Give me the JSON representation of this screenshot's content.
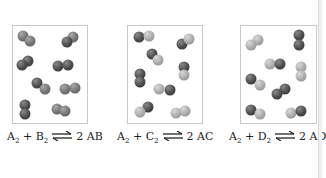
{
  "figure": {
    "panels": [
      {
        "id": "AB",
        "equation": {
          "r1": "A",
          "r1_sub": "2",
          "plus": "+",
          "r2": "B",
          "r2_sub": "2",
          "coef": "2",
          "product": "AB"
        },
        "box": {
          "x": 12,
          "y": 25,
          "w": 76,
          "h": 99
        },
        "molecules": [
          [
            {
              "x": 23,
              "y": 36,
              "c": "mid"
            },
            {
              "x": 30,
              "y": 41,
              "c": "mid"
            }
          ],
          [
            {
              "x": 73,
              "y": 37,
              "c": "mid"
            },
            {
              "x": 67,
              "y": 42,
              "c": "dark"
            }
          ],
          [
            {
              "x": 28,
              "y": 61,
              "c": "dark"
            },
            {
              "x": 22,
              "y": 65,
              "c": "dark"
            }
          ],
          [
            {
              "x": 58,
              "y": 66,
              "c": "dark"
            },
            {
              "x": 68,
              "y": 65,
              "c": "dark"
            }
          ],
          [
            {
              "x": 37,
              "y": 83,
              "c": "dark"
            },
            {
              "x": 45,
              "y": 89,
              "c": "mid"
            }
          ],
          [
            {
              "x": 65,
              "y": 89,
              "c": "mid"
            },
            {
              "x": 75,
              "y": 88,
              "c": "mid"
            }
          ],
          [
            {
              "x": 25,
              "y": 105,
              "c": "dark"
            },
            {
              "x": 25,
              "y": 114,
              "c": "dark"
            }
          ],
          [
            {
              "x": 57,
              "y": 109,
              "c": "mid"
            },
            {
              "x": 65,
              "y": 111,
              "c": "mid"
            }
          ]
        ]
      },
      {
        "id": "AC",
        "equation": {
          "r1": "A",
          "r1_sub": "2",
          "plus": "+",
          "r2": "C",
          "r2_sub": "2",
          "coef": "2",
          "product": "AC"
        },
        "box": {
          "x": 127,
          "y": 25,
          "w": 76,
          "h": 99
        },
        "molecules": [
          [
            {
              "x": 139,
              "y": 37,
              "c": "dark"
            },
            {
              "x": 149,
              "y": 36,
              "c": "light"
            }
          ],
          [
            {
              "x": 182,
              "y": 44,
              "c": "dark"
            },
            {
              "x": 189,
              "y": 39,
              "c": "light"
            }
          ],
          [
            {
              "x": 152,
              "y": 54,
              "c": "dark"
            },
            {
              "x": 158,
              "y": 60,
              "c": "light"
            }
          ],
          [
            {
              "x": 140,
              "y": 74,
              "c": "dark"
            },
            {
              "x": 140,
              "y": 82,
              "c": "dark"
            }
          ],
          [
            {
              "x": 184,
              "y": 67,
              "c": "dark"
            },
            {
              "x": 184,
              "y": 75,
              "c": "light"
            }
          ],
          [
            {
              "x": 159,
              "y": 89,
              "c": "light"
            },
            {
              "x": 170,
              "y": 90,
              "c": "dark"
            }
          ],
          [
            {
              "x": 148,
              "y": 107,
              "c": "dark"
            },
            {
              "x": 140,
              "y": 112,
              "c": "light"
            }
          ],
          [
            {
              "x": 176,
              "y": 113,
              "c": "light"
            },
            {
              "x": 185,
              "y": 111,
              "c": "light"
            }
          ]
        ]
      },
      {
        "id": "AD",
        "equation": {
          "r1": "A",
          "r1_sub": "2",
          "plus": "+",
          "r2": "D",
          "r2_sub": "2",
          "coef": "2",
          "product": "AD"
        },
        "box": {
          "x": 240,
          "y": 25,
          "w": 77,
          "h": 99
        },
        "molecules": [
          [
            {
              "x": 258,
              "y": 40,
              "c": "light"
            },
            {
              "x": 251,
              "y": 45,
              "c": "light"
            }
          ],
          [
            {
              "x": 299,
              "y": 35,
              "c": "dark"
            },
            {
              "x": 299,
              "y": 45,
              "c": "dark"
            }
          ],
          [
            {
              "x": 270,
              "y": 64,
              "c": "light"
            },
            {
              "x": 280,
              "y": 64,
              "c": "dark"
            }
          ],
          [
            {
              "x": 301,
              "y": 67,
              "c": "light"
            },
            {
              "x": 301,
              "y": 76,
              "c": "light"
            }
          ],
          [
            {
              "x": 251,
              "y": 79,
              "c": "dark"
            },
            {
              "x": 260,
              "y": 85,
              "c": "light"
            }
          ],
          [
            {
              "x": 285,
              "y": 89,
              "c": "dark"
            },
            {
              "x": 277,
              "y": 94,
              "c": "dark"
            }
          ],
          [
            {
              "x": 251,
              "y": 110,
              "c": "dark"
            },
            {
              "x": 260,
              "y": 114,
              "c": "light"
            }
          ],
          [
            {
              "x": 291,
              "y": 113,
              "c": "light"
            },
            {
              "x": 301,
              "y": 111,
              "c": "dark"
            }
          ]
        ]
      }
    ],
    "equation_positions": [
      {
        "x": 7,
        "y": 130
      },
      {
        "x": 117,
        "y": 130
      },
      {
        "x": 229,
        "y": 130
      }
    ],
    "colors": {
      "box_border": "#c8c8c8",
      "atom_dark": "#4a4a4a",
      "atom_mid": "#737373",
      "atom_light": "#a9a9a9",
      "text": "#222222"
    }
  }
}
